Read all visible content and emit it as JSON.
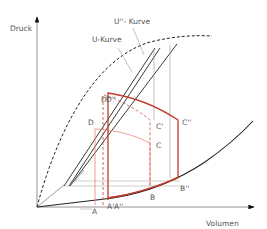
{
  "axes": {
    "y_label": "Druck",
    "x_label": "Volumen"
  },
  "curves": {
    "u_curve_label": "U-Kurve",
    "u2_curve_label": "U''- Kurve"
  },
  "points": {
    "A": "A",
    "A1": "A'",
    "A2": "A''",
    "B": "B",
    "B2": "B''",
    "C": "C",
    "C1": "C'",
    "C2": "C''",
    "D": "D",
    "D1": "D'",
    "D2": "D''"
  },
  "colors": {
    "axis": "#777777",
    "curve": "#222222",
    "red_dark": "#c0392b",
    "red_light": "#e8867a",
    "guide": "#999999"
  }
}
